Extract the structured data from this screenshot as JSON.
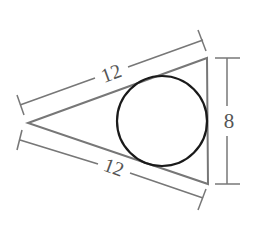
{
  "diagram": {
    "labels": {
      "upper_side": "12",
      "lower_side": "12",
      "base": "8"
    },
    "colors": {
      "triangle": "#777777",
      "circle": "#1a1a1a",
      "dimension": "#777777",
      "text": "#555555"
    },
    "triangle": {
      "vertices": [
        [
          28,
          123
        ],
        [
          207,
          58
        ],
        [
          208,
          184
        ]
      ]
    },
    "circle": {
      "cx": 162,
      "cy": 121,
      "r": 45
    }
  }
}
